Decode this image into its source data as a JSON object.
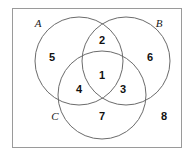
{
  "diagram": {
    "type": "venn-diagram-3-set",
    "title": "",
    "universe_rect": {
      "x": 12,
      "y": 8,
      "width": 170,
      "height": 140,
      "stroke": "#9a9a9a",
      "fill": "#ffffff"
    },
    "stroke_color": "#6b6b6b",
    "number_color": "#111111",
    "label_color": "#1a1a1a",
    "background": "#ffffff",
    "sets": [
      {
        "id": "A",
        "label": "A",
        "cx": 79,
        "cy": 61,
        "r": 44,
        "label_x": 38,
        "label_y": 27
      },
      {
        "id": "B",
        "label": "B",
        "cx": 126,
        "cy": 61,
        "r": 44,
        "label_x": 159,
        "label_y": 27
      },
      {
        "id": "C",
        "label": "C",
        "cx": 102,
        "cy": 95,
        "r": 44,
        "label_x": 55,
        "label_y": 120
      },
      {
        "id": "U",
        "label": "",
        "cx": 0,
        "cy": 0,
        "r": 0,
        "label_x": 0,
        "label_y": 0
      }
    ],
    "regions": [
      {
        "id": "ABC",
        "number": "1",
        "description": "A and B and C",
        "x": 102,
        "y": 76
      },
      {
        "id": "AB",
        "number": "2",
        "description": "A and B only",
        "x": 102,
        "y": 41
      },
      {
        "id": "BC",
        "number": "3",
        "description": "B and C only",
        "x": 123,
        "y": 90
      },
      {
        "id": "AC",
        "number": "4",
        "description": "A and C only",
        "x": 79,
        "y": 90
      },
      {
        "id": "A-only",
        "number": "5",
        "description": "A only",
        "x": 52,
        "y": 58
      },
      {
        "id": "B-only",
        "number": "6",
        "description": "B only",
        "x": 150,
        "y": 58
      },
      {
        "id": "C-only",
        "number": "7",
        "description": "C only",
        "x": 102,
        "y": 117
      },
      {
        "id": "outside",
        "number": "8",
        "description": "outside all sets",
        "x": 164,
        "y": 117
      }
    ]
  }
}
